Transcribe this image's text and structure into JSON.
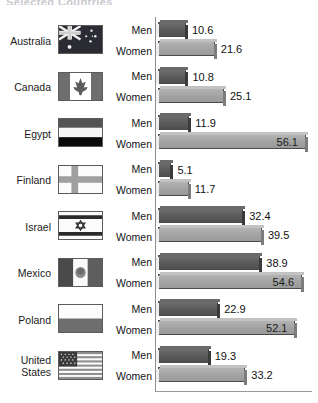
{
  "chart_title": "Selected Countries",
  "series_labels": {
    "men": "Men",
    "women": "Women"
  },
  "chart_data": {
    "type": "bar",
    "title": "Selected Countries",
    "orientation": "horizontal",
    "xlabel": "",
    "ylabel": "",
    "xlim": [
      0,
      60
    ],
    "grid": false,
    "legend": "inline-row-labels",
    "categories": [
      "Australia",
      "Canada",
      "Egypt",
      "Finland",
      "Israel",
      "Mexico",
      "Poland",
      "United States"
    ],
    "series": [
      {
        "name": "Men",
        "color": "#5a5a5a",
        "values": [
          10.6,
          10.8,
          11.9,
          5.1,
          32.4,
          38.9,
          22.9,
          19.3
        ]
      },
      {
        "name": "Women",
        "color": "#a8a8a8",
        "values": [
          21.6,
          25.1,
          56.1,
          11.7,
          39.5,
          54.6,
          52.1,
          33.2
        ]
      }
    ]
  },
  "rows": [
    {
      "country": "Australia",
      "country_line1": "Australia",
      "country_line2": "",
      "flag": "flag-australia",
      "men_label": "Men",
      "women_label": "Women",
      "men_value": 10.6,
      "women_value": 21.6,
      "men_text": "10.6",
      "women_text": "21.6",
      "men_inside": false,
      "women_inside": false
    },
    {
      "country": "Canada",
      "country_line1": "Canada",
      "country_line2": "",
      "flag": "flag-canada",
      "men_label": "Men",
      "women_label": "Women",
      "men_value": 10.8,
      "women_value": 25.1,
      "men_text": "10.8",
      "women_text": "25.1",
      "men_inside": false,
      "women_inside": false
    },
    {
      "country": "Egypt",
      "country_line1": "Egypt",
      "country_line2": "",
      "flag": "flag-egypt",
      "men_label": "Men",
      "women_label": "Women",
      "men_value": 11.9,
      "women_value": 56.1,
      "men_text": "11.9",
      "women_text": "56.1",
      "men_inside": false,
      "women_inside": true
    },
    {
      "country": "Finland",
      "country_line1": "Finland",
      "country_line2": "",
      "flag": "flag-finland",
      "men_label": "Men",
      "women_label": "Women",
      "men_value": 5.1,
      "women_value": 11.7,
      "men_text": "5.1",
      "women_text": "11.7",
      "men_inside": false,
      "women_inside": false
    },
    {
      "country": "Israel",
      "country_line1": "Israel",
      "country_line2": "",
      "flag": "flag-israel",
      "men_label": "Men",
      "women_label": "Women",
      "men_value": 32.4,
      "women_value": 39.5,
      "men_text": "32.4",
      "women_text": "39.5",
      "men_inside": false,
      "women_inside": false
    },
    {
      "country": "Mexico",
      "country_line1": "Mexico",
      "country_line2": "",
      "flag": "flag-mexico",
      "men_label": "Men",
      "women_label": "Women",
      "men_value": 38.9,
      "women_value": 54.6,
      "men_text": "38.9",
      "women_text": "54.6",
      "men_inside": false,
      "women_inside": true
    },
    {
      "country": "Poland",
      "country_line1": "Poland",
      "country_line2": "",
      "flag": "flag-poland",
      "men_label": "Men",
      "women_label": "Women",
      "men_value": 22.9,
      "women_value": 52.1,
      "men_text": "22.9",
      "women_text": "52.1",
      "men_inside": false,
      "women_inside": true
    },
    {
      "country": "United States",
      "country_line1": "United",
      "country_line2": "States",
      "flag": "flag-united-states",
      "men_label": "Men",
      "women_label": "Women",
      "men_value": 19.3,
      "women_value": 33.2,
      "men_text": "19.3",
      "women_text": "33.2",
      "men_inside": false,
      "women_inside": false
    }
  ],
  "colors": {
    "men_bar": "#5a5a5a",
    "women_bar": "#a8a8a8",
    "axis": "#8d8d8d",
    "text": "#111111",
    "background": "#ffffff"
  }
}
